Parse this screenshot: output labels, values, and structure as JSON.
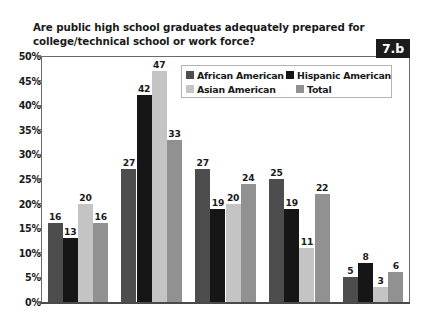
{
  "title": "Are public high school graduates adequately prepared for college/technical school or work force?",
  "badge": "7.b",
  "legend": [
    {
      "label": "African American",
      "color": "#4d4d4d"
    },
    {
      "label": "Hispanic American",
      "color": "#161616"
    },
    {
      "label": "Asian American",
      "color": "#c4c4c4"
    },
    {
      "label": "Total",
      "color": "#919191"
    }
  ],
  "yticks": [
    "0%",
    "5%",
    "10%",
    "15%",
    "20%",
    "25%",
    "30%",
    "35%",
    "40%",
    "45%",
    "50%"
  ],
  "chart_data": {
    "type": "bar",
    "title": "Are public high school graduates adequately prepared for college/technical school or work force?",
    "xlabel": "",
    "ylabel": "",
    "ylim": [
      0,
      50
    ],
    "ytick_values": [
      0,
      5,
      10,
      15,
      20,
      25,
      30,
      35,
      40,
      45,
      50
    ],
    "ytick_labels": [
      "0%",
      "5%",
      "10%",
      "15%",
      "20%",
      "25%",
      "30%",
      "35%",
      "40%",
      "45%",
      "50%"
    ],
    "grid": false,
    "legend_position": "top-right-inside",
    "categories": [
      "Group 1",
      "Group 2",
      "Group 3",
      "Group 4",
      "Group 5"
    ],
    "category_labels_shown": false,
    "data_labels": true,
    "series": [
      {
        "name": "African American",
        "color": "#4d4d4d",
        "values": [
          16,
          27,
          27,
          25,
          5
        ]
      },
      {
        "name": "Hispanic American",
        "color": "#161616",
        "values": [
          13,
          42,
          19,
          19,
          8
        ]
      },
      {
        "name": "Asian American",
        "color": "#c4c4c4",
        "values": [
          20,
          47,
          20,
          11,
          3
        ]
      },
      {
        "name": "Total",
        "color": "#919191",
        "values": [
          16,
          33,
          24,
          22,
          6
        ]
      }
    ]
  }
}
